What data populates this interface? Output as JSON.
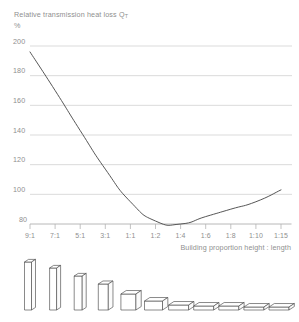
{
  "chart_data": {
    "type": "line",
    "title": "Relative transmission heat loss Q",
    "title_subscript": "T",
    "ylabel": "%",
    "xlabel": "Building proportion height : length",
    "categories": [
      "9:1",
      "7:1",
      "5:1",
      "3:1",
      "1:1",
      "1:2",
      "1:4",
      "1:6",
      "1:8",
      "1:10",
      "1:15"
    ],
    "yticks": [
      "200",
      "180",
      "160",
      "140",
      "120",
      "100",
      "80"
    ],
    "ylim": [
      80,
      200
    ],
    "grid": true,
    "legend": "none",
    "series": [
      {
        "name": "Relative transmission heat loss QT",
        "values": [
          196,
          170,
          143,
          117,
          95,
          82,
          80,
          85,
          90,
          95,
          103
        ]
      }
    ],
    "annotations": [
      "Minimum heat loss occurs at building proportion near 1:3 to 1:4",
      "Curve rises again for very flat proportions"
    ],
    "colors": {
      "curve": "#4d4d4d",
      "grid": "#d2d2d2",
      "axis": "#b4b4b4",
      "text": "#8f8f8f",
      "block_outline": "#4a4a4a",
      "block_fill": "#ffffff"
    }
  },
  "blocks": {
    "caption": "Building proportion blocks",
    "items": [
      {
        "label": "9:1",
        "w": 7,
        "h": 48,
        "d": 6
      },
      {
        "label": "7:1",
        "w": 7,
        "h": 42,
        "d": 6
      },
      {
        "label": "5:1",
        "w": 8,
        "h": 34,
        "d": 6
      },
      {
        "label": "3:1",
        "w": 10,
        "h": 26,
        "d": 7
      },
      {
        "label": "1:1",
        "w": 15,
        "h": 16,
        "d": 8
      },
      {
        "label": "1:2",
        "w": 18,
        "h": 9,
        "d": 8
      },
      {
        "label": "1:4",
        "w": 20,
        "h": 5,
        "d": 8
      },
      {
        "label": "1:6",
        "w": 20,
        "h": 4,
        "d": 8
      },
      {
        "label": "1:8",
        "w": 20,
        "h": 4,
        "d": 8
      },
      {
        "label": "1:10",
        "w": 20,
        "h": 3,
        "d": 8
      },
      {
        "label": "1:15",
        "w": 20,
        "h": 3,
        "d": 8
      }
    ]
  }
}
